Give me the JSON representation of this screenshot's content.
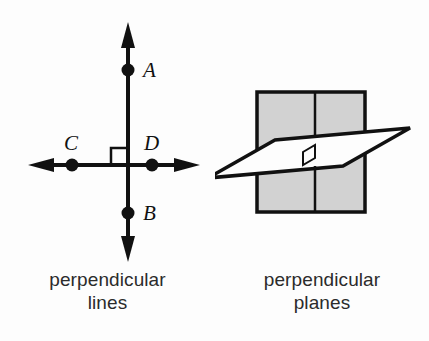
{
  "figure": {
    "title_implicit": "perpendicular lines and perpendicular planes",
    "background_color": "#fdfdfd",
    "stroke_color": "#111111",
    "plane_fill_gray": "#d2d2d2",
    "plane_fill_white": "#fdfdfd"
  },
  "left_panel": {
    "name": "perpendicular-lines-diagram",
    "caption_line1": "perpendicular",
    "caption_line2": "lines",
    "points": [
      {
        "label": "A",
        "x": 128,
        "y": 70,
        "label_x": 143,
        "label_y": 70
      },
      {
        "label": "B",
        "x": 128,
        "y": 213,
        "label_x": 143,
        "label_y": 213
      },
      {
        "label": "C",
        "x": 72,
        "y": 165,
        "label_x": 72,
        "label_y": 143
      },
      {
        "label": "D",
        "x": 152,
        "y": 165,
        "label_x": 152,
        "label_y": 143
      }
    ],
    "vertical_line": {
      "x": 128,
      "y_top": 22,
      "y_bottom": 262
    },
    "horizontal_line": {
      "y": 165,
      "x_left": 28,
      "x_right": 200
    },
    "right_angle_marker": {
      "size": 17,
      "corner_x": 128,
      "corner_y": 165,
      "quadrant": "upper-left"
    },
    "arrowheads": 4
  },
  "right_panel": {
    "name": "perpendicular-planes-diagram",
    "caption_line1": "perpendicular",
    "caption_line2": "planes",
    "vertical_plane": {
      "shape": "rectangle",
      "fill": "#d2d2d2",
      "left": 42,
      "top": 92,
      "right": 150,
      "bottom": 212,
      "fold_line_x": 100
    },
    "horizontal_plane": {
      "shape": "parallelogram",
      "fill": "#fdfdfd",
      "points": "-7,178 60,140 195,128 128,166"
    },
    "right_angle_marker": {
      "present": true,
      "size": 12
    }
  }
}
